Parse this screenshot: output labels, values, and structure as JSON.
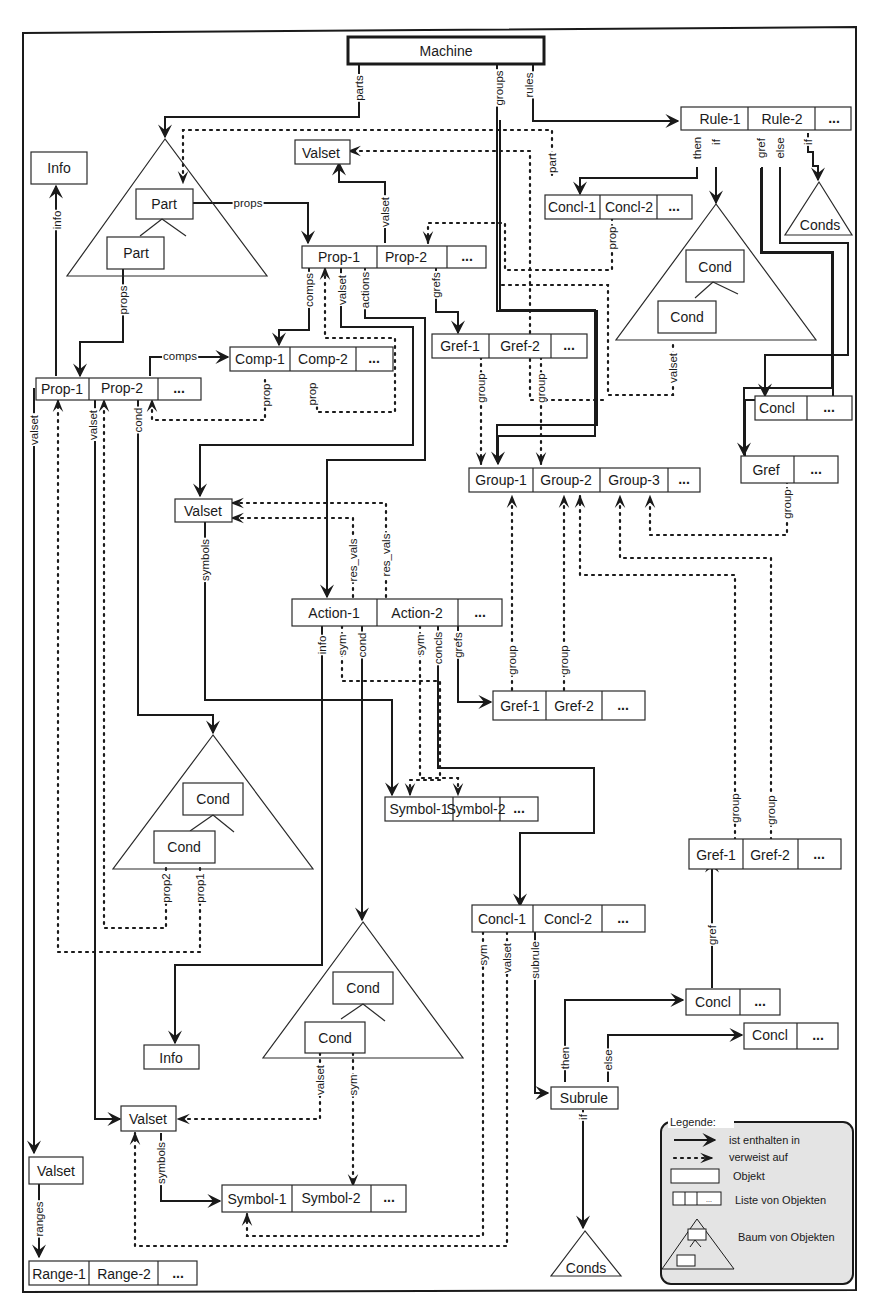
{
  "diagram": {
    "title": "Machine",
    "nodes": {
      "machine": "Machine",
      "info_top": "Info",
      "part_a": "Part",
      "part_b": "Part",
      "valset_top": "Valset",
      "prop1_top": "Prop-1",
      "prop2_top": "Prop-2",
      "ellipsis": "...",
      "rule1": "Rule-1",
      "rule2": "Rule-2",
      "concl1_top": "Concl-1",
      "concl2_top": "Concl-2",
      "conds_top": "Conds",
      "cond_a": "Cond",
      "cond_b": "Cond",
      "prop1_left": "Prop-1",
      "prop2_left": "Prop-2",
      "comp1": "Comp-1",
      "comp2": "Comp-2",
      "gref1_top": "Gref-1",
      "gref2_top": "Gref-2",
      "concl_right": "Concl",
      "gref_right": "Gref",
      "group1": "Group-1",
      "group2": "Group-2",
      "group3": "Group-3",
      "valset_mid": "Valset",
      "action1": "Action-1",
      "action2": "Action-2",
      "gref1_mid": "Gref-1",
      "gref2_mid": "Gref-2",
      "cond_c": "Cond",
      "cond_d": "Cond",
      "symbol1_mid": "Symbol-1",
      "symbol2_mid": "Symbol-2",
      "gref1_low": "Gref-1",
      "gref2_low": "Gref-2",
      "concl1_low": "Concl-1",
      "concl2_low": "Concl-2",
      "cond_e": "Cond",
      "cond_f": "Cond",
      "info_low": "Info",
      "concl_then": "Concl",
      "concl_else": "Concl",
      "subrule": "Subrule",
      "valset_low": "Valset",
      "valset_left": "Valset",
      "symbol1_low": "Symbol-1",
      "symbol2_low": "Symbol-2",
      "conds_low": "Conds",
      "range1": "Range-1",
      "range2": "Range-2"
    },
    "edge_labels": {
      "parts": "parts",
      "groups": "groups",
      "rules": "rules",
      "info": "info",
      "props_part": "props",
      "props_part2": "props",
      "valset_prop": "valset",
      "comps": "comps",
      "valset_p1": "valset",
      "actions": "actions",
      "grefs": "grefs",
      "part": "part",
      "then": "then",
      "if": "if",
      "gref_rule": "gref",
      "else_rule": "else",
      "if_rule2": "if",
      "prop_concl": "prop",
      "comps_left": "comps",
      "prop_c1": "prop",
      "prop_c2": "prop",
      "valset_cond": "valset",
      "group_g1": "group",
      "group_g2": "group",
      "group_gref": "group",
      "valset_left": "valset",
      "valset_left2": "valset",
      "cond_left": "cond",
      "symbols": "symbols",
      "res_vals1": "res_vals",
      "res_vals2": "res_vals",
      "info_a1": "info",
      "sym_a1": "sym",
      "cond_a1": "cond",
      "sym_a2": "sym",
      "concls": "concls",
      "grefs_a2": "grefs",
      "group_m1": "group",
      "group_m2": "group",
      "group_l1": "group",
      "group_l2": "group",
      "prop2": "prop2",
      "prop1": "prop1",
      "sym_c1": "sym",
      "valset_c1": "valset",
      "subrule": "subrule",
      "gref_low": "gref",
      "then_sub": "then",
      "else_sub": "else",
      "if_sub": "if",
      "valset_cond2": "valset",
      "sym_cond2": "sym",
      "symbols_low": "symbols",
      "ranges": "ranges"
    },
    "legend": {
      "title": "Legende:",
      "contains": "ist enthalten in",
      "refers": "verweist auf",
      "object": "Objekt",
      "list": "Liste von Objekten",
      "tree": "Baum von Objekten",
      "list_ellipsis": "..."
    }
  }
}
